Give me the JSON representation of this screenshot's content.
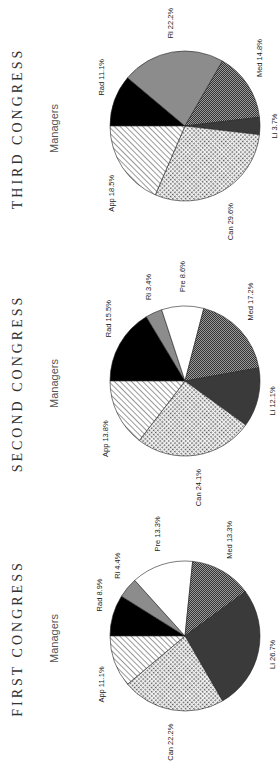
{
  "chart_data": [
    {
      "type": "pie",
      "title": "FIRST CONGRESS",
      "subtitle": "Managers",
      "categories": [
        "Rad",
        "Ri",
        "Pre",
        "Med",
        "Li",
        "Can",
        "App"
      ],
      "values": [
        8.9,
        4.4,
        13.3,
        13.3,
        26.7,
        22.2,
        11.1
      ],
      "labels": [
        "Rad 8.9%",
        "Ri 4.4%",
        "Pre 13.3%",
        "Med 13.3%",
        "Li 26.7%",
        "Can 22.2%",
        "App 11.1%"
      ]
    },
    {
      "type": "pie",
      "title": "SECOND CONGRESS",
      "subtitle": "Managers",
      "categories": [
        "Rad",
        "Ri",
        "Pre",
        "Med",
        "Li",
        "Can",
        "App"
      ],
      "values": [
        15.5,
        3.4,
        8.6,
        17.2,
        12.1,
        24.1,
        13.8
      ],
      "labels": [
        "Rad 15.5%",
        "Ri 3.4%",
        "Pre 8.6%",
        "Med 17.2%",
        "Li 12.1%",
        "Can 24.1%",
        "App 13.8%"
      ]
    },
    {
      "type": "pie",
      "title": "THIRD CONGRESS",
      "subtitle": "Managers",
      "categories": [
        "Rad",
        "Ri",
        "Med",
        "Li",
        "Can",
        "App"
      ],
      "values": [
        11.1,
        22.2,
        14.8,
        3.7,
        29.6,
        18.5
      ],
      "labels": [
        "Rad 11.1%",
        "Ri 22.2%",
        "Med 14.8%",
        "Li 3.7%",
        "Can 29.6%",
        "App 18.5%"
      ]
    }
  ],
  "orientation": "rotated-90-ccw",
  "fills": {
    "Rad": "solid-black",
    "Ri": "solid-gray",
    "Pre": "white",
    "Med": "fine-dither-gray",
    "Li": "dark-gray",
    "Can": "checkered-light",
    "App": "diagonal-hatch"
  }
}
